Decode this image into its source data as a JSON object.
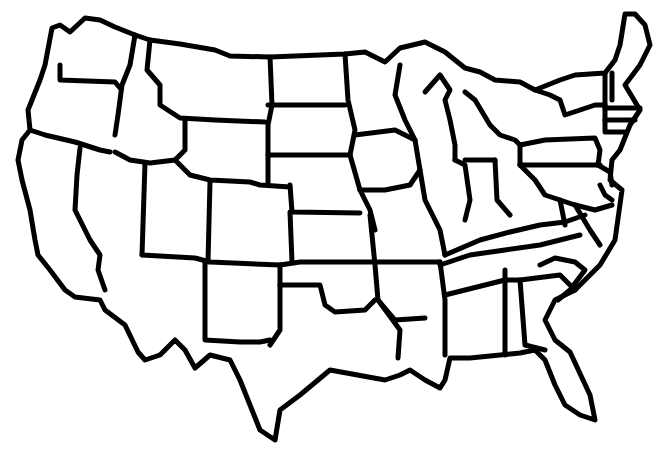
{
  "map": {
    "title": "",
    "type": "blank outline map",
    "region": "Contiguous United States",
    "labels": [],
    "colors": {
      "background": "#ffffff",
      "outline": "#000000"
    }
  }
}
